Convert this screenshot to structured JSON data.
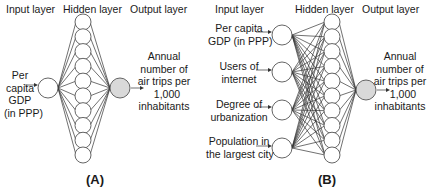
{
  "panels": [
    {
      "id": "A",
      "label": "(A)",
      "headers": {
        "input": "Input layer",
        "hidden": "Hidden layer",
        "output": "Output layer"
      },
      "inputs": [
        {
          "lines": [
            "Per",
            "capita",
            "GDP",
            "(in PPP)"
          ]
        }
      ],
      "hidden_count": 10,
      "output": {
        "lines": [
          "Annual",
          "number of",
          "air trips per",
          "1,000",
          "inhabitants"
        ]
      }
    },
    {
      "id": "B",
      "label": "(B)",
      "headers": {
        "input": "Input layer",
        "hidden": "Hidden layer",
        "output": "Output layer"
      },
      "inputs": [
        {
          "lines": [
            "Per capita",
            "GDP (in PPP)"
          ]
        },
        {
          "lines": [
            "Users of",
            "internet"
          ]
        },
        {
          "lines": [
            "Degree of",
            "urbanization"
          ]
        },
        {
          "lines": [
            "Population in",
            "the largest city"
          ]
        }
      ],
      "hidden_count": 10,
      "output": {
        "lines": [
          "Annual",
          "number of",
          "air trips per",
          "1,000",
          "inhabitants"
        ]
      }
    }
  ],
  "colors": {
    "node_stroke": "#555555",
    "node_fill": "#ffffff",
    "output_fill": "#d9d9d9",
    "edge": "#333333"
  }
}
